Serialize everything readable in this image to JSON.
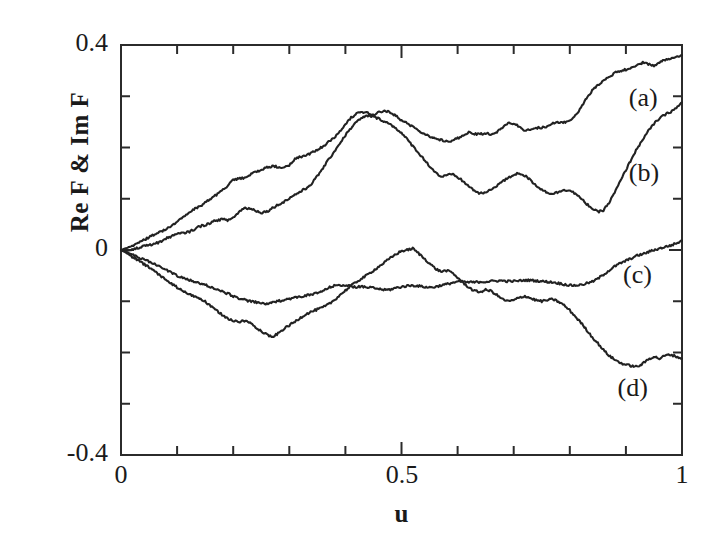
{
  "chart_data": {
    "type": "line",
    "title": "",
    "xlabel": "u",
    "ylabel": "Re F  &  Im F",
    "xlim": [
      0,
      1
    ],
    "ylim": [
      -0.4,
      0.4
    ],
    "xticks": [
      0,
      0.5,
      1
    ],
    "xtick_labels": [
      "0",
      "0.5",
      "1"
    ],
    "yticks": [
      -0.4,
      0,
      0.4
    ],
    "ytick_labels": [
      "-0.4",
      "0",
      "0.4"
    ],
    "x_minor_tick_interval": 0.1,
    "y_minor_tick_interval": 0.1,
    "grid": false,
    "legend_position": "inside-right-inline",
    "line_color": "#222222",
    "series": [
      {
        "name": "(a)",
        "label_x": 0.93,
        "label_y": 0.29,
        "x": [
          0.0,
          0.01,
          0.02,
          0.03,
          0.04,
          0.05,
          0.06,
          0.07,
          0.08,
          0.09,
          0.1,
          0.11,
          0.12,
          0.13,
          0.14,
          0.15,
          0.16,
          0.17,
          0.18,
          0.19,
          0.2,
          0.21,
          0.22,
          0.23,
          0.24,
          0.25,
          0.26,
          0.27,
          0.28,
          0.29,
          0.3,
          0.31,
          0.32,
          0.33,
          0.34,
          0.35,
          0.36,
          0.37,
          0.38,
          0.39,
          0.4,
          0.41,
          0.42,
          0.43,
          0.44,
          0.45,
          0.46,
          0.47,
          0.48,
          0.49,
          0.5,
          0.51,
          0.52,
          0.53,
          0.54,
          0.55,
          0.56,
          0.57,
          0.58,
          0.59,
          0.6,
          0.61,
          0.62,
          0.63,
          0.64,
          0.65,
          0.66,
          0.67,
          0.68,
          0.69,
          0.7,
          0.71,
          0.72,
          0.73,
          0.74,
          0.75,
          0.76,
          0.77,
          0.78,
          0.79,
          0.8,
          0.81,
          0.82,
          0.83,
          0.84,
          0.85,
          0.86,
          0.87,
          0.88,
          0.89,
          0.9,
          0.91,
          0.92,
          0.93,
          0.94,
          0.95,
          0.96,
          0.97,
          0.98,
          0.99,
          1.0
        ],
        "y": [
          0.0,
          0.004,
          0.008,
          0.013,
          0.019,
          0.025,
          0.031,
          0.036,
          0.04,
          0.047,
          0.056,
          0.063,
          0.072,
          0.079,
          0.085,
          0.092,
          0.1,
          0.108,
          0.115,
          0.126,
          0.136,
          0.139,
          0.141,
          0.147,
          0.153,
          0.156,
          0.161,
          0.163,
          0.162,
          0.16,
          0.166,
          0.177,
          0.182,
          0.184,
          0.19,
          0.196,
          0.202,
          0.211,
          0.219,
          0.232,
          0.246,
          0.258,
          0.266,
          0.268,
          0.267,
          0.263,
          0.269,
          0.272,
          0.269,
          0.262,
          0.253,
          0.247,
          0.241,
          0.234,
          0.227,
          0.222,
          0.217,
          0.215,
          0.213,
          0.213,
          0.218,
          0.224,
          0.229,
          0.226,
          0.226,
          0.228,
          0.226,
          0.23,
          0.239,
          0.247,
          0.247,
          0.24,
          0.233,
          0.235,
          0.238,
          0.239,
          0.241,
          0.247,
          0.249,
          0.249,
          0.252,
          0.262,
          0.278,
          0.296,
          0.311,
          0.322,
          0.331,
          0.338,
          0.345,
          0.35,
          0.352,
          0.356,
          0.36,
          0.366,
          0.363,
          0.36,
          0.366,
          0.371,
          0.374,
          0.376,
          0.38
        ]
      },
      {
        "name": "(b)",
        "label_x": 0.93,
        "label_y": 0.145,
        "x": [
          0.0,
          0.01,
          0.02,
          0.03,
          0.04,
          0.05,
          0.06,
          0.07,
          0.08,
          0.09,
          0.1,
          0.11,
          0.12,
          0.13,
          0.14,
          0.15,
          0.16,
          0.17,
          0.18,
          0.19,
          0.2,
          0.21,
          0.22,
          0.23,
          0.24,
          0.25,
          0.26,
          0.27,
          0.28,
          0.29,
          0.3,
          0.31,
          0.32,
          0.33,
          0.34,
          0.35,
          0.36,
          0.37,
          0.38,
          0.39,
          0.4,
          0.41,
          0.42,
          0.43,
          0.44,
          0.45,
          0.46,
          0.47,
          0.48,
          0.49,
          0.5,
          0.51,
          0.52,
          0.53,
          0.54,
          0.55,
          0.56,
          0.57,
          0.58,
          0.59,
          0.6,
          0.61,
          0.62,
          0.63,
          0.64,
          0.65,
          0.66,
          0.67,
          0.68,
          0.69,
          0.7,
          0.71,
          0.72,
          0.73,
          0.74,
          0.75,
          0.76,
          0.77,
          0.78,
          0.79,
          0.8,
          0.81,
          0.82,
          0.83,
          0.84,
          0.85,
          0.86,
          0.87,
          0.88,
          0.89,
          0.9,
          0.91,
          0.92,
          0.93,
          0.94,
          0.95,
          0.96,
          0.97,
          0.98,
          0.99,
          1.0
        ],
        "y": [
          0.0,
          -0.002,
          0.0,
          0.004,
          0.007,
          0.009,
          0.012,
          0.016,
          0.022,
          0.027,
          0.031,
          0.033,
          0.035,
          0.04,
          0.046,
          0.049,
          0.053,
          0.058,
          0.06,
          0.058,
          0.063,
          0.074,
          0.082,
          0.081,
          0.077,
          0.073,
          0.075,
          0.082,
          0.088,
          0.094,
          0.101,
          0.108,
          0.114,
          0.12,
          0.13,
          0.144,
          0.16,
          0.176,
          0.192,
          0.208,
          0.224,
          0.238,
          0.25,
          0.258,
          0.262,
          0.26,
          0.256,
          0.251,
          0.245,
          0.238,
          0.228,
          0.216,
          0.203,
          0.19,
          0.177,
          0.164,
          0.152,
          0.143,
          0.145,
          0.148,
          0.142,
          0.134,
          0.124,
          0.116,
          0.11,
          0.112,
          0.118,
          0.126,
          0.134,
          0.14,
          0.147,
          0.15,
          0.145,
          0.136,
          0.126,
          0.118,
          0.112,
          0.11,
          0.113,
          0.118,
          0.116,
          0.11,
          0.1,
          0.09,
          0.081,
          0.074,
          0.078,
          0.092,
          0.112,
          0.134,
          0.156,
          0.178,
          0.198,
          0.216,
          0.232,
          0.246,
          0.257,
          0.264,
          0.27,
          0.277,
          0.288
        ]
      },
      {
        "name": "(c)",
        "label_x": 0.92,
        "label_y": -0.055,
        "x": [
          0.0,
          0.01,
          0.02,
          0.03,
          0.04,
          0.05,
          0.06,
          0.07,
          0.08,
          0.09,
          0.1,
          0.11,
          0.12,
          0.13,
          0.14,
          0.15,
          0.16,
          0.17,
          0.18,
          0.19,
          0.2,
          0.21,
          0.22,
          0.23,
          0.24,
          0.25,
          0.26,
          0.27,
          0.28,
          0.29,
          0.3,
          0.31,
          0.32,
          0.33,
          0.34,
          0.35,
          0.36,
          0.37,
          0.38,
          0.39,
          0.4,
          0.41,
          0.42,
          0.43,
          0.44,
          0.45,
          0.46,
          0.47,
          0.48,
          0.49,
          0.5,
          0.51,
          0.52,
          0.53,
          0.54,
          0.55,
          0.56,
          0.57,
          0.58,
          0.59,
          0.6,
          0.61,
          0.62,
          0.63,
          0.64,
          0.65,
          0.66,
          0.67,
          0.68,
          0.69,
          0.7,
          0.71,
          0.72,
          0.73,
          0.74,
          0.75,
          0.76,
          0.77,
          0.78,
          0.79,
          0.8,
          0.81,
          0.82,
          0.83,
          0.84,
          0.85,
          0.86,
          0.87,
          0.88,
          0.89,
          0.9,
          0.91,
          0.92,
          0.93,
          0.94,
          0.95,
          0.96,
          0.97,
          0.98,
          0.99,
          1.0
        ],
        "y": [
          0.0,
          -0.004,
          -0.009,
          -0.014,
          -0.018,
          -0.023,
          -0.028,
          -0.033,
          -0.038,
          -0.044,
          -0.05,
          -0.055,
          -0.058,
          -0.062,
          -0.065,
          -0.068,
          -0.072,
          -0.077,
          -0.081,
          -0.085,
          -0.09,
          -0.094,
          -0.097,
          -0.1,
          -0.102,
          -0.104,
          -0.105,
          -0.103,
          -0.1,
          -0.097,
          -0.095,
          -0.093,
          -0.091,
          -0.089,
          -0.087,
          -0.084,
          -0.08,
          -0.074,
          -0.07,
          -0.068,
          -0.069,
          -0.071,
          -0.072,
          -0.072,
          -0.073,
          -0.074,
          -0.076,
          -0.078,
          -0.077,
          -0.074,
          -0.072,
          -0.07,
          -0.069,
          -0.07,
          -0.072,
          -0.073,
          -0.072,
          -0.069,
          -0.067,
          -0.064,
          -0.062,
          -0.062,
          -0.063,
          -0.063,
          -0.062,
          -0.062,
          -0.061,
          -0.06,
          -0.06,
          -0.061,
          -0.061,
          -0.06,
          -0.059,
          -0.059,
          -0.06,
          -0.061,
          -0.062,
          -0.063,
          -0.065,
          -0.067,
          -0.069,
          -0.069,
          -0.068,
          -0.065,
          -0.062,
          -0.056,
          -0.048,
          -0.04,
          -0.032,
          -0.026,
          -0.021,
          -0.016,
          -0.011,
          -0.008,
          -0.004,
          0.0,
          0.003,
          0.006,
          0.009,
          0.013,
          0.018
        ]
      },
      {
        "name": "(d)",
        "label_x": 0.91,
        "label_y": -0.275,
        "x": [
          0.0,
          0.01,
          0.02,
          0.03,
          0.04,
          0.05,
          0.06,
          0.07,
          0.08,
          0.09,
          0.1,
          0.11,
          0.12,
          0.13,
          0.14,
          0.15,
          0.16,
          0.17,
          0.18,
          0.19,
          0.2,
          0.21,
          0.22,
          0.23,
          0.24,
          0.25,
          0.26,
          0.27,
          0.28,
          0.29,
          0.3,
          0.31,
          0.32,
          0.33,
          0.34,
          0.35,
          0.36,
          0.37,
          0.38,
          0.39,
          0.4,
          0.41,
          0.42,
          0.43,
          0.44,
          0.45,
          0.46,
          0.47,
          0.48,
          0.49,
          0.5,
          0.51,
          0.52,
          0.53,
          0.54,
          0.55,
          0.56,
          0.57,
          0.58,
          0.59,
          0.6,
          0.61,
          0.62,
          0.63,
          0.64,
          0.65,
          0.66,
          0.67,
          0.68,
          0.69,
          0.7,
          0.71,
          0.72,
          0.73,
          0.74,
          0.75,
          0.76,
          0.77,
          0.78,
          0.79,
          0.8,
          0.81,
          0.82,
          0.83,
          0.84,
          0.85,
          0.86,
          0.87,
          0.88,
          0.89,
          0.9,
          0.91,
          0.92,
          0.93,
          0.94,
          0.95,
          0.96,
          0.97,
          0.98,
          0.99,
          1.0
        ],
        "y": [
          0.0,
          -0.006,
          -0.013,
          -0.02,
          -0.027,
          -0.034,
          -0.042,
          -0.05,
          -0.058,
          -0.066,
          -0.073,
          -0.08,
          -0.086,
          -0.09,
          -0.094,
          -0.101,
          -0.11,
          -0.118,
          -0.126,
          -0.133,
          -0.139,
          -0.14,
          -0.138,
          -0.142,
          -0.15,
          -0.158,
          -0.165,
          -0.17,
          -0.163,
          -0.154,
          -0.147,
          -0.14,
          -0.132,
          -0.125,
          -0.12,
          -0.116,
          -0.112,
          -0.106,
          -0.098,
          -0.088,
          -0.079,
          -0.07,
          -0.062,
          -0.055,
          -0.048,
          -0.04,
          -0.032,
          -0.024,
          -0.016,
          -0.008,
          -0.002,
          0.0,
          0.003,
          -0.006,
          -0.016,
          -0.026,
          -0.036,
          -0.042,
          -0.04,
          -0.044,
          -0.054,
          -0.064,
          -0.073,
          -0.08,
          -0.082,
          -0.078,
          -0.08,
          -0.088,
          -0.096,
          -0.1,
          -0.098,
          -0.093,
          -0.09,
          -0.094,
          -0.098,
          -0.1,
          -0.098,
          -0.096,
          -0.101,
          -0.108,
          -0.118,
          -0.13,
          -0.142,
          -0.156,
          -0.17,
          -0.182,
          -0.195,
          -0.206,
          -0.214,
          -0.22,
          -0.224,
          -0.226,
          -0.228,
          -0.222,
          -0.213,
          -0.208,
          -0.212,
          -0.206,
          -0.204,
          -0.208,
          -0.212
        ]
      }
    ]
  },
  "axes": {
    "frame_color": "#2b2b2b",
    "frame_width": 2
  }
}
